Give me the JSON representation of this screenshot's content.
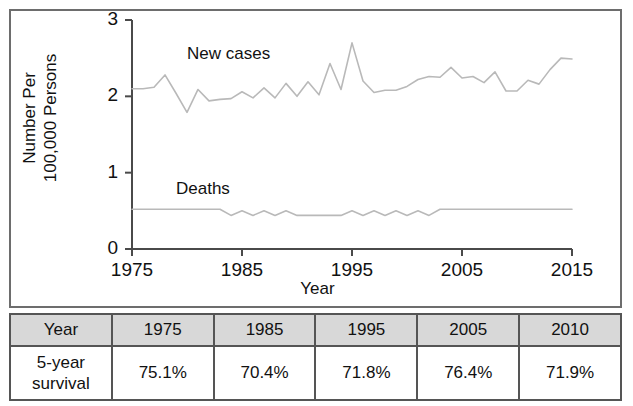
{
  "chart_data": {
    "type": "line",
    "title": "",
    "xlabel": "Year",
    "ylabel_line1": "Number Per",
    "ylabel_line2": "100,000 Persons",
    "xlim": [
      1975,
      2015
    ],
    "ylim": [
      0,
      3
    ],
    "xticks": [
      "1975",
      "1985",
      "1995",
      "2005",
      "2015"
    ],
    "xtick_values": [
      1975,
      1985,
      1995,
      2005,
      2015
    ],
    "yticks": [
      "0",
      "1",
      "2",
      "3"
    ],
    "ytick_values": [
      0,
      1,
      2,
      3
    ],
    "grid": false,
    "legend": "inline-annotations",
    "line_color": "#b9b9b9",
    "axis_color": "#4a4a4a",
    "x": [
      1975,
      1976,
      1977,
      1978,
      1979,
      1980,
      1981,
      1982,
      1983,
      1984,
      1985,
      1986,
      1987,
      1988,
      1989,
      1990,
      1991,
      1992,
      1993,
      1994,
      1995,
      1996,
      1997,
      1998,
      1999,
      2000,
      2001,
      2002,
      2003,
      2004,
      2005,
      2006,
      2007,
      2008,
      2009,
      2010,
      2011,
      2012,
      2013,
      2014,
      2015
    ],
    "series": [
      {
        "name": "New cases",
        "label_x": 1980,
        "label_y": 2.55,
        "values": [
          2.1,
          2.1,
          2.12,
          2.28,
          2.04,
          1.79,
          2.09,
          1.94,
          1.96,
          1.97,
          2.06,
          1.98,
          2.11,
          1.98,
          2.17,
          2.0,
          2.19,
          2.02,
          2.43,
          2.09,
          2.7,
          2.2,
          2.05,
          2.08,
          2.08,
          2.13,
          2.22,
          2.26,
          2.25,
          2.38,
          2.24,
          2.26,
          2.18,
          2.32,
          2.07,
          2.07,
          2.21,
          2.16,
          2.35,
          2.5,
          2.49
        ]
      },
      {
        "name": "Deaths",
        "label_x": 1979,
        "label_y": 0.78,
        "values": [
          0.52,
          0.52,
          0.52,
          0.52,
          0.52,
          0.52,
          0.52,
          0.52,
          0.52,
          0.44,
          0.5,
          0.44,
          0.5,
          0.44,
          0.5,
          0.44,
          0.44,
          0.44,
          0.44,
          0.44,
          0.5,
          0.44,
          0.5,
          0.44,
          0.5,
          0.44,
          0.5,
          0.44,
          0.52,
          0.52,
          0.52,
          0.52,
          0.52,
          0.52,
          0.52,
          0.52,
          0.52,
          0.52,
          0.52,
          0.52,
          0.52
        ]
      }
    ]
  },
  "table": {
    "header": [
      "Year",
      "1975",
      "1985",
      "1995",
      "2005",
      "2010"
    ],
    "rows": [
      {
        "label": "5-year",
        "label2": "survival",
        "cells": [
          "75.1%",
          "70.4%",
          "71.8%",
          "76.4%",
          "71.9%"
        ]
      }
    ]
  }
}
